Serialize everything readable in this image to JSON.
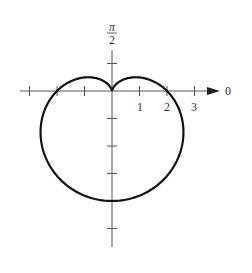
{
  "chart_data": {
    "type": "line",
    "subtype": "polar",
    "title": "",
    "equation": "r = 2 - 2 sin θ",
    "curve": "cardioid",
    "axis_labels": {
      "polar_axis": "0",
      "vertical_axis_top": "π/2",
      "vertical_axis_top_numerator": "π",
      "vertical_axis_top_denominator": "2"
    },
    "x_tick_labels": [
      "1",
      "2",
      "3"
    ],
    "x_ticks": [
      -3,
      -2,
      -1,
      1,
      2,
      3
    ],
    "y_ticks": [
      1,
      -1,
      -2,
      -3,
      -4,
      -5
    ],
    "xlim": [
      -3.6,
      4.0
    ],
    "ylim": [
      -5.4,
      1.8
    ],
    "grid": false,
    "legend": null,
    "key_points": [
      {
        "theta": "0",
        "r": 2,
        "x": 2,
        "y": 0
      },
      {
        "theta": "π/2",
        "r": 0,
        "x": 0,
        "y": 0
      },
      {
        "theta": "π",
        "r": 2,
        "x": -2,
        "y": 0
      },
      {
        "theta": "3π/2",
        "r": 4,
        "x": 0,
        "y": -4
      }
    ],
    "colors": {
      "curve": "#111111",
      "axes": "#555555"
    }
  }
}
